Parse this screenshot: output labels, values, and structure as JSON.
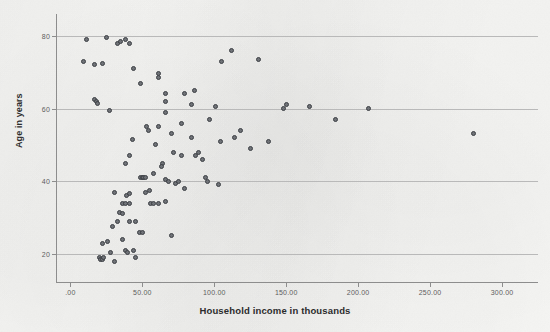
{
  "chart_data": {
    "type": "scatter",
    "title": "",
    "xlabel": "Household income in thousands",
    "ylabel": "Age in years",
    "xlim": [
      -10,
      325
    ],
    "ylim": [
      12,
      86
    ],
    "grid": "horizontal",
    "legend": "none",
    "marker": {
      "shape": "circle",
      "fill_color": "#6f7277",
      "edge_color": "#3c3f44",
      "size_px": 5
    },
    "xticks": [
      0,
      50,
      100,
      150,
      200,
      250,
      300
    ],
    "xtick_labels": [
      ".00",
      "50.00",
      "100.00",
      "150.00",
      "200.00",
      "250.00",
      "300.00"
    ],
    "yticks": [
      20,
      40,
      60,
      80
    ],
    "ytick_labels": [
      "20",
      "40",
      "60",
      "80"
    ],
    "n_points": 103,
    "points": [
      [
        11,
        79
      ],
      [
        25,
        79.5
      ],
      [
        33,
        78
      ],
      [
        35,
        78.5
      ],
      [
        38,
        79
      ],
      [
        9,
        73
      ],
      [
        17,
        72
      ],
      [
        22,
        72.5
      ],
      [
        41,
        78
      ],
      [
        44,
        71
      ],
      [
        49,
        67
      ],
      [
        61,
        68.5
      ],
      [
        61,
        69.5
      ],
      [
        66,
        64
      ],
      [
        17,
        62.5
      ],
      [
        18,
        62
      ],
      [
        19,
        61.5
      ],
      [
        79,
        64
      ],
      [
        86,
        65
      ],
      [
        27,
        59.5
      ],
      [
        66,
        59
      ],
      [
        101,
        60.5
      ],
      [
        53,
        55
      ],
      [
        54,
        54
      ],
      [
        61,
        55
      ],
      [
        77,
        56
      ],
      [
        43,
        51.5
      ],
      [
        70,
        53
      ],
      [
        84,
        52
      ],
      [
        97,
        57
      ],
      [
        41,
        47
      ],
      [
        59,
        50
      ],
      [
        89,
        48
      ],
      [
        104,
        51
      ],
      [
        38,
        45
      ],
      [
        49,
        41
      ],
      [
        50,
        41
      ],
      [
        51,
        41
      ],
      [
        52,
        41
      ],
      [
        58,
        42
      ],
      [
        64,
        45
      ],
      [
        63,
        44
      ],
      [
        66,
        40.5
      ],
      [
        68,
        40
      ],
      [
        73,
        39.5
      ],
      [
        75,
        40
      ],
      [
        79,
        38
      ],
      [
        31,
        37
      ],
      [
        39,
        36
      ],
      [
        41,
        36.5
      ],
      [
        36,
        34
      ],
      [
        38,
        34
      ],
      [
        41,
        34
      ],
      [
        34,
        31.5
      ],
      [
        36,
        31
      ],
      [
        52,
        37
      ],
      [
        55,
        37.5
      ],
      [
        56,
        34
      ],
      [
        58,
        34
      ],
      [
        61,
        34
      ],
      [
        66,
        34.5
      ],
      [
        33,
        29
      ],
      [
        41,
        29
      ],
      [
        45,
        29
      ],
      [
        29,
        27.5
      ],
      [
        48,
        26
      ],
      [
        50,
        26
      ],
      [
        70,
        25
      ],
      [
        22,
        23
      ],
      [
        26,
        23.5
      ],
      [
        36,
        24
      ],
      [
        44,
        21
      ],
      [
        28,
        20.5
      ],
      [
        38,
        21
      ],
      [
        40,
        20.5
      ],
      [
        20,
        19
      ],
      [
        21,
        18.5
      ],
      [
        22,
        18.5
      ],
      [
        23,
        19
      ],
      [
        31,
        18
      ],
      [
        45,
        19
      ],
      [
        112,
        76
      ],
      [
        105,
        73
      ],
      [
        131,
        73.5
      ],
      [
        95,
        40
      ],
      [
        103,
        39
      ],
      [
        94,
        41
      ],
      [
        166,
        60.5
      ],
      [
        184,
        57
      ],
      [
        148,
        60
      ],
      [
        150,
        61
      ],
      [
        207,
        60
      ],
      [
        280,
        53
      ],
      [
        125,
        49
      ],
      [
        138,
        51
      ],
      [
        114,
        52
      ],
      [
        118,
        54
      ],
      [
        87,
        47
      ],
      [
        92,
        46
      ],
      [
        72,
        48
      ],
      [
        77,
        47
      ],
      [
        66,
        62
      ],
      [
        84,
        61
      ]
    ]
  },
  "axes": {
    "y_title": "Age in years",
    "x_title": "Household income in thousands"
  }
}
